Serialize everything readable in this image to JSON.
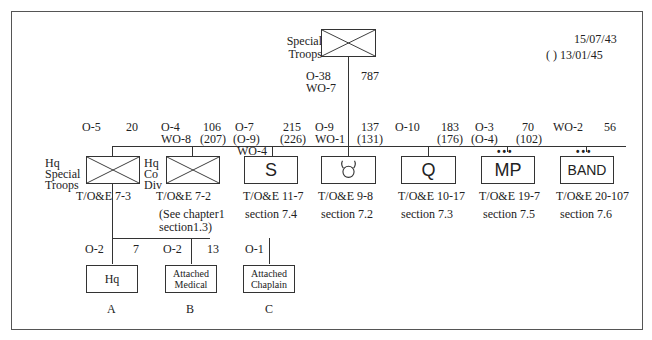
{
  "dates": {
    "line1": "15/07/43",
    "line2": "( ) 13/01/45"
  },
  "top": {
    "label1": "Special",
    "label2": "Troops",
    "officers": "O-38",
    "warrants": "WO-7",
    "strength": "787"
  },
  "units": [
    {
      "id": "hq-special-troops",
      "officers": "O-5",
      "strength": "20",
      "name1": "Hq",
      "name2": "Special",
      "name3": "Troops",
      "toe": "T/O&E 7-3"
    },
    {
      "id": "hq-co-div",
      "officers": "O-4",
      "warrants": "WO-8",
      "strength": "106",
      "strength_alt": "(207)",
      "name1": "Hq",
      "name2": "Co",
      "name3": "Div",
      "toe": "T/O&E 7-2",
      "note1": "(See chapter1",
      "note2": "section1.3)"
    },
    {
      "id": "signal",
      "officers": "O-7",
      "officers_alt": "(O-9)",
      "warrants": "WO-4",
      "strength": "215",
      "strength_alt": "(226)",
      "symbol": "S",
      "toe": "T/O&E 11-7",
      "section": "section 7.4"
    },
    {
      "id": "ordnance",
      "officers": "O-9",
      "warrants": "WO-1",
      "strength": "137",
      "strength_alt": "(131)",
      "symbol": "ordnance-bullhorns",
      "toe": "T/O&E 9-8",
      "section": "section 7.2"
    },
    {
      "id": "quartermaster",
      "officers": "O-10",
      "strength": "183",
      "strength_alt": "(176)",
      "symbol": "Q",
      "toe": "T/O&E 10-17",
      "section": "section 7.3"
    },
    {
      "id": "military-police",
      "officers": "O-3",
      "officers_alt": "(O-4)",
      "strength": "70",
      "strength_alt": "(102)",
      "symbol": "MP",
      "toe": "T/O&E 19-7",
      "section": "section 7.5",
      "size": "•••"
    },
    {
      "id": "band",
      "warrants": "WO-2",
      "strength": "56",
      "symbol": "BAND",
      "toe": "T/O&E 20-107",
      "section": "section 7.6",
      "size": "•••"
    }
  ],
  "sub_units": [
    {
      "id": "hq",
      "officers": "O-2",
      "strength": "7",
      "label1": "Hq",
      "letter": "A"
    },
    {
      "id": "attached-medical",
      "officers": "O-2",
      "strength": "13",
      "label1": "Attached",
      "label2": "Medical",
      "letter": "B"
    },
    {
      "id": "attached-chaplain",
      "officers": "O-1",
      "label1": "Attached",
      "label2": "Chaplain",
      "letter": "C"
    }
  ]
}
